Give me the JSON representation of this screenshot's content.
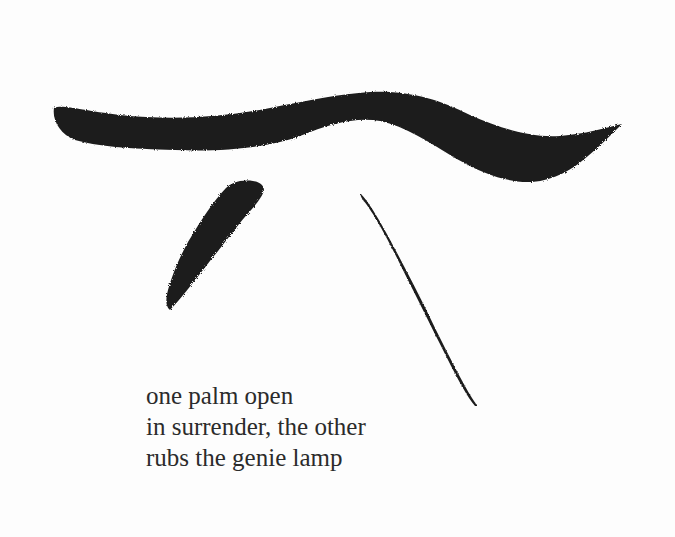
{
  "artwork": {
    "ink_color": "#1c1c1c",
    "paper_color": "#fdfdfd",
    "strokes": [
      {
        "name": "horizontal-wave-stroke"
      },
      {
        "name": "left-diagonal-stroke"
      },
      {
        "name": "right-diagonal-stroke"
      }
    ]
  },
  "poem": {
    "lines": [
      "one palm open",
      "in surrender, the other",
      "rubs the genie lamp"
    ]
  }
}
